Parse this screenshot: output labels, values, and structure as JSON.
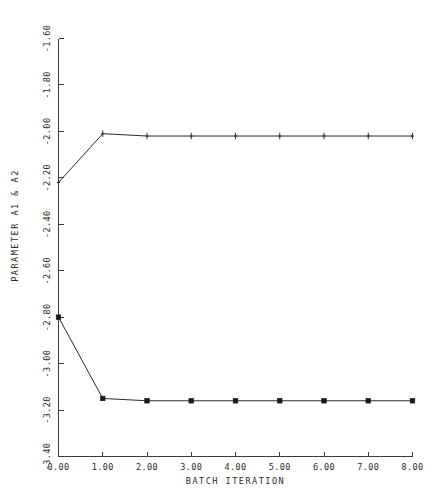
{
  "chart_data": {
    "type": "line",
    "title": "",
    "xlabel": "BATCH ITERATION",
    "ylabel": "PARAMETER A1 & A2",
    "xlim": [
      0.0,
      8.0
    ],
    "ylim": [
      -3.4,
      -1.6
    ],
    "grid": false,
    "legend": "none",
    "x_tick_labels": [
      "0.00",
      "1.00",
      "2.00",
      "3.00",
      "4.00",
      "5.00",
      "6.00",
      "7.00",
      "8.00"
    ],
    "x_ticks": [
      0,
      1,
      2,
      3,
      4,
      5,
      6,
      7,
      8
    ],
    "y_tick_labels": [
      "-3.40",
      "-3.20",
      "-3.00",
      "-2.80",
      "-2.60",
      "-2.40",
      "-2.20",
      "-2.00",
      "-1.80",
      "-1.60"
    ],
    "y_ticks": [
      -3.4,
      -3.2,
      -3.0,
      -2.8,
      -2.6,
      -2.4,
      -2.2,
      -2.0,
      -1.8,
      -1.6
    ],
    "x": [
      0,
      1,
      2,
      3,
      4,
      5,
      6,
      7,
      8
    ],
    "series": [
      {
        "name": "A1",
        "marker": "plus",
        "values": [
          -2.22,
          -2.01,
          -2.02,
          -2.02,
          -2.02,
          -2.02,
          -2.02,
          -2.02,
          -2.02
        ]
      },
      {
        "name": "A2",
        "marker": "square",
        "values": [
          -2.8,
          -3.15,
          -3.16,
          -3.16,
          -3.16,
          -3.16,
          -3.16,
          -3.16,
          -3.16
        ]
      }
    ]
  },
  "colors": {
    "line": "#2b2b2b",
    "axis": "#3a3a3a",
    "background": "#ffffff"
  }
}
